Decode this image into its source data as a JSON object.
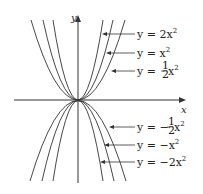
{
  "axes": {
    "x_label": "x",
    "y_label": "y"
  },
  "curves": [
    {
      "label_prefix": "y = 2x",
      "exp": "2",
      "a": 2
    },
    {
      "label_prefix": "y = x",
      "exp": "2",
      "a": 1
    },
    {
      "label_prefix": "y = ",
      "frac": "1/2",
      "suffix": "x",
      "exp": "2",
      "a": 0.5
    },
    {
      "label_prefix": "y = −",
      "frac": "1/2",
      "suffix": "x",
      "exp": "2",
      "a": -0.5
    },
    {
      "label_prefix": "y = −x",
      "exp": "2",
      "a": -1
    },
    {
      "label_prefix": "y = −2x",
      "exp": "2",
      "a": -2
    }
  ],
  "colors": {
    "curve": "#333333",
    "axis": "#333333",
    "text": "#222222"
  }
}
